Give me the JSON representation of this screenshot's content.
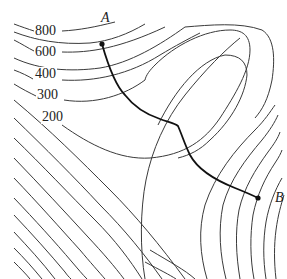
{
  "figure": {
    "type": "contour-map",
    "contour_labels": [
      {
        "value": "800",
        "x": 34,
        "y": 24
      },
      {
        "value": "600",
        "x": 34,
        "y": 45
      },
      {
        "value": "400",
        "x": 34,
        "y": 67
      },
      {
        "value": "300",
        "x": 36,
        "y": 88
      },
      {
        "value": "200",
        "x": 41,
        "y": 110
      }
    ],
    "points": [
      {
        "name": "A",
        "label": "A",
        "x": 102,
        "y": 44
      },
      {
        "name": "B",
        "label": "B",
        "x": 258,
        "y": 198
      }
    ],
    "path": {
      "from": "A",
      "to": "B",
      "description": "route between A and B crossing contours"
    },
    "colors": {
      "lines": "#3a3a3a",
      "path": "#111111",
      "background": "#ffffff"
    }
  }
}
